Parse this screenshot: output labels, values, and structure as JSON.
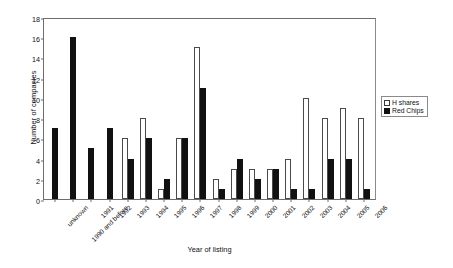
{
  "chart_data": {
    "type": "bar",
    "title": "",
    "xlabel": "Year of listing",
    "ylabel": "Number of companies",
    "ylim": [
      0,
      18
    ],
    "ytick_step": 2,
    "yticks": [
      0,
      2,
      4,
      6,
      8,
      10,
      12,
      14,
      16,
      18
    ],
    "grid": false,
    "legend_position": "right",
    "categories": [
      "unknown",
      "1990 and before",
      "1991",
      "1992",
      "1993",
      "1994",
      "1995",
      "1996",
      "1997",
      "1998",
      "1999",
      "2000",
      "2001",
      "2002",
      "2003",
      "2004",
      "2005",
      "2006"
    ],
    "series": [
      {
        "name": "H shares",
        "color": "#ffffff",
        "edge_color": "#4a4a4a",
        "values": [
          0,
          0,
          0,
          0,
          6,
          8,
          1,
          6,
          15,
          2,
          3,
          3,
          3,
          4,
          10,
          8,
          9,
          8
        ]
      },
      {
        "name": "Red Chips",
        "color": "#111111",
        "edge_color": "#111111",
        "values": [
          7,
          16,
          5,
          7,
          4,
          6,
          2,
          6,
          11,
          1,
          4,
          2,
          3,
          1,
          1,
          4,
          4,
          1
        ]
      }
    ]
  },
  "legend": {
    "items": [
      {
        "label": "H shares",
        "swatch": "h-shares"
      },
      {
        "label": "Red Chips",
        "swatch": "red-chips"
      }
    ]
  }
}
